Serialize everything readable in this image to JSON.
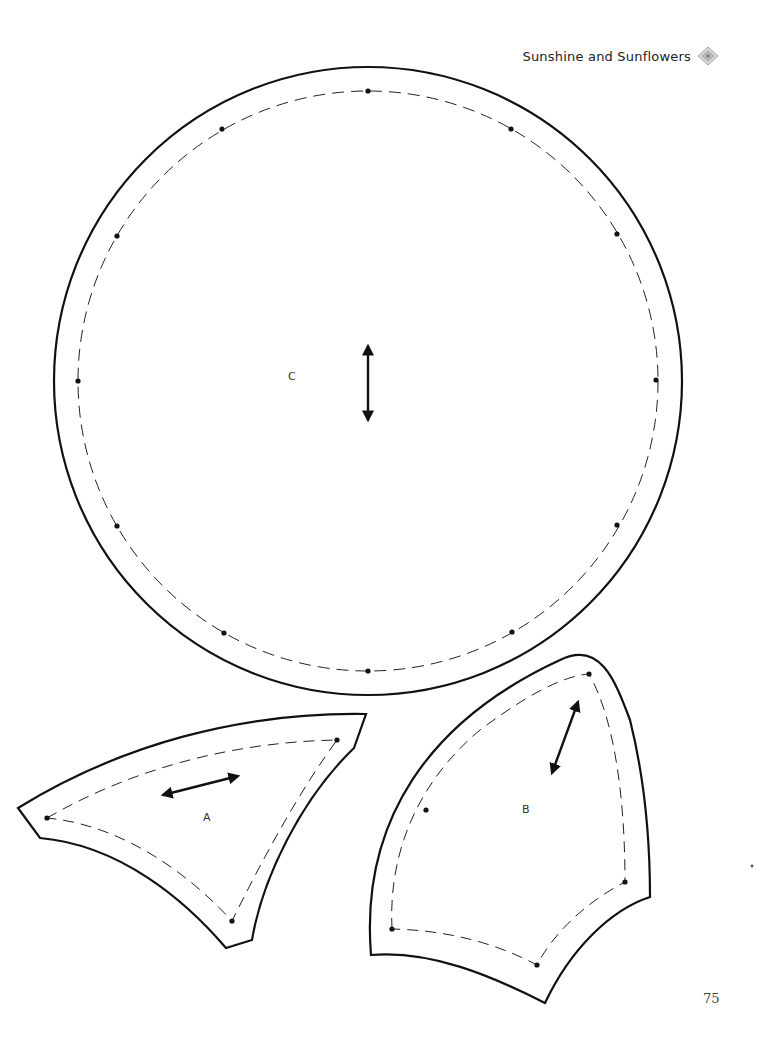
{
  "header": {
    "title": "Sunshine and Sunflowers",
    "icon": "diamond-ornament-icon"
  },
  "pieces": [
    {
      "label": "C",
      "shape": "circle",
      "grain_arrow": "vertical"
    },
    {
      "label": "A",
      "shape": "curved-wedge",
      "grain_arrow": "diagonal"
    },
    {
      "label": "B",
      "shape": "curved-petal",
      "grain_arrow": "diagonal"
    }
  ],
  "footer": {
    "page_number": "75"
  },
  "colors": {
    "line": "#111111",
    "background": "#ffffff",
    "ornament": "#bdbdbd"
  }
}
